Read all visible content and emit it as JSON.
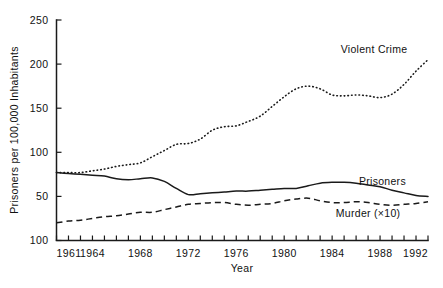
{
  "chart_data": {
    "type": "line",
    "title": "",
    "xlabel": "Year",
    "ylabel": "Prisoners per 100,000 Inhabitants",
    "xlim": [
      1961,
      1992
    ],
    "ylim": [
      0,
      250
    ],
    "grid": false,
    "legend_position": "inline-right",
    "x_tick_labels": [
      "1961",
      "1964",
      "1968",
      "1972",
      "1976",
      "1980",
      "1984",
      "1988",
      "1992"
    ],
    "x_tick_values": [
      1961,
      1964,
      1968,
      1972,
      1976,
      1980,
      1984,
      1988,
      1992
    ],
    "x_minor_ticks_every": 1,
    "y_tick_labels": [
      "250",
      "200",
      "150",
      "100",
      "50",
      "100"
    ],
    "y_tick_values": [
      250,
      200,
      150,
      100,
      50,
      0
    ],
    "x": [
      1961,
      1962,
      1963,
      1964,
      1965,
      1966,
      1967,
      1968,
      1969,
      1970,
      1971,
      1972,
      1973,
      1974,
      1975,
      1976,
      1977,
      1978,
      1979,
      1980,
      1981,
      1982,
      1983,
      1984,
      1985,
      1986,
      1987,
      1988,
      1989,
      1990,
      1991,
      1992
    ],
    "series": [
      {
        "name": "Violent Crime",
        "line_style": "dotted",
        "color": "#1a1a1a",
        "label_text": "Violent Crime",
        "values": [
          77,
          77,
          77,
          79,
          81,
          84,
          86,
          88,
          95,
          102,
          109,
          110,
          115,
          125,
          129,
          130,
          135,
          141,
          152,
          163,
          172,
          175,
          172,
          165,
          164,
          165,
          164,
          162,
          166,
          177,
          192,
          205
        ]
      },
      {
        "name": "Prisoners",
        "line_style": "solid",
        "color": "#1a1a1a",
        "label_text": "Prisoners",
        "values": [
          77,
          76,
          75,
          74,
          73,
          70,
          69,
          70,
          71,
          67,
          59,
          52,
          53,
          54,
          55,
          56,
          56,
          57,
          58,
          59,
          59,
          62,
          65,
          66,
          66,
          65,
          63,
          61,
          57,
          54,
          51,
          50
        ]
      },
      {
        "name": "Murder (×10)",
        "line_style": "dashed",
        "color": "#1a1a1a",
        "label_text": "Murder (×10)",
        "values": [
          20,
          22,
          23,
          25,
          27,
          28,
          30,
          32,
          32,
          35,
          38,
          41,
          42,
          43,
          43,
          41,
          40,
          41,
          42,
          45,
          47,
          48,
          45,
          43,
          43,
          44,
          43,
          41,
          40,
          41,
          42,
          44
        ]
      }
    ],
    "annotations": [
      {
        "text": "Violent Crime",
        "x": 1987.5,
        "y": 213
      },
      {
        "text": "Prisoners",
        "x": 1988.2,
        "y": 63
      },
      {
        "text": "Murder (×10)",
        "x": 1987.0,
        "y": 27
      }
    ]
  }
}
